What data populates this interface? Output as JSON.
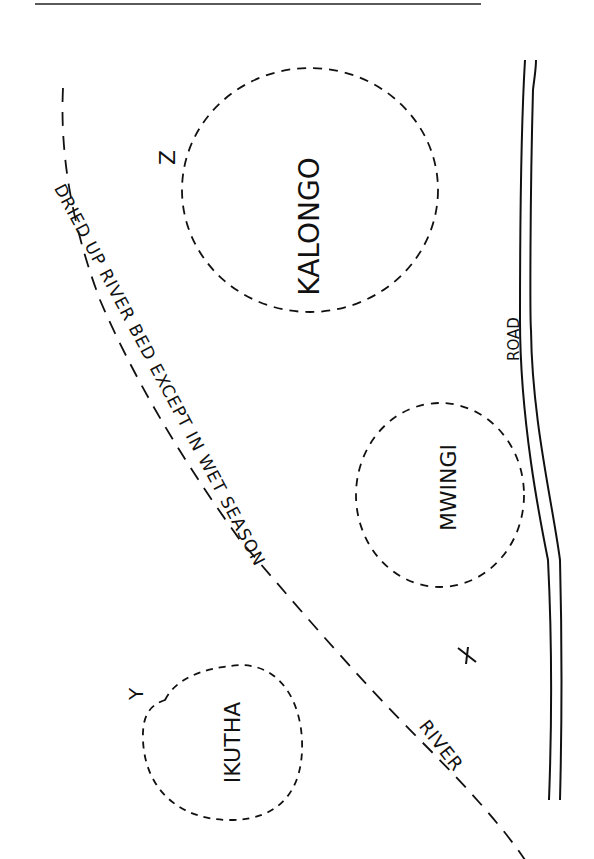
{
  "map": {
    "title": "",
    "colors": {
      "ink": "#111111",
      "paper": "#ffffff"
    },
    "towns": [
      {
        "name": "KALONGO",
        "boundary": "dashed"
      },
      {
        "name": "MWINGI",
        "boundary": "dashed"
      },
      {
        "name": "IKUTHA",
        "boundary": "dashed"
      }
    ],
    "markers": [
      {
        "label": "X"
      },
      {
        "label": "Y"
      },
      {
        "label": "Z"
      }
    ],
    "river": {
      "label": "RIVER",
      "annotation": "DRIED UP RIVER BED EXCEPT IN WET SEASON",
      "style": "dashed"
    },
    "road": {
      "label": "ROAD",
      "style": "double-line"
    }
  }
}
